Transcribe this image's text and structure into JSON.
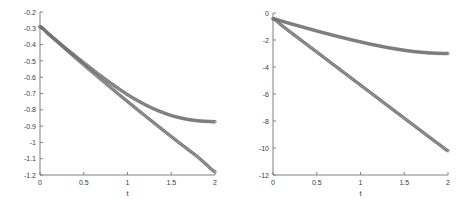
{
  "figure": {
    "background": "#ffffff",
    "axis_color": "#808080",
    "tick_label_color": "#3a3a3a",
    "panel_count": 2
  },
  "chart_data": [
    {
      "id": "left-panel",
      "type": "line",
      "title": "",
      "subtitle": "",
      "xlabel": "t",
      "ylabel": "",
      "xlim": [
        0,
        2
      ],
      "ylim": [
        -1.2,
        -0.2
      ],
      "grid": false,
      "legend": null,
      "xticks": [
        0,
        0.5,
        1,
        1.5,
        2
      ],
      "xticklabels": [
        "0",
        "0.5",
        "1",
        "1.5",
        "2"
      ],
      "yticks": [
        -0.2,
        -0.3,
        -0.4,
        -0.5,
        -0.6,
        -0.7,
        -0.8,
        -0.9,
        -1,
        -1.1,
        -1.2
      ],
      "yticklabels": [
        "-0.2",
        "-0.3",
        "-0.4",
        "-0.5",
        "-0.6",
        "-0.7",
        "-0.8",
        "-0.9",
        "-1",
        "-1.1",
        "-1.2"
      ],
      "marker": "circle",
      "marker_color": "#6e6e6e",
      "series": [
        {
          "name": "upper-curve",
          "color": "#6e6e6e",
          "x": [
            0,
            0.1,
            0.2,
            0.3,
            0.4,
            0.5,
            0.6,
            0.7,
            0.8,
            0.9,
            1.0,
            1.1,
            1.2,
            1.3,
            1.4,
            1.5,
            1.6,
            1.7,
            1.8,
            1.9,
            2.0
          ],
          "values": [
            -0.29,
            -0.335,
            -0.38,
            -0.425,
            -0.468,
            -0.511,
            -0.553,
            -0.594,
            -0.633,
            -0.671,
            -0.707,
            -0.739,
            -0.768,
            -0.794,
            -0.816,
            -0.835,
            -0.849,
            -0.86,
            -0.867,
            -0.871,
            -0.873
          ]
        },
        {
          "name": "lower-curve",
          "color": "#6e6e6e",
          "x": [
            0,
            0.1,
            0.2,
            0.3,
            0.4,
            0.5,
            0.6,
            0.7,
            0.8,
            0.9,
            1.0,
            1.1,
            1.2,
            1.3,
            1.4,
            1.5,
            1.6,
            1.7,
            1.8,
            1.9,
            2.0
          ],
          "values": [
            -0.29,
            -0.337,
            -0.384,
            -0.431,
            -0.478,
            -0.524,
            -0.57,
            -0.615,
            -0.66,
            -0.705,
            -0.749,
            -0.793,
            -0.836,
            -0.879,
            -0.922,
            -0.964,
            -1.006,
            -1.047,
            -1.088,
            -1.135,
            -1.18
          ]
        }
      ]
    },
    {
      "id": "right-panel",
      "type": "line",
      "title": "",
      "subtitle": "",
      "xlabel": "t",
      "ylabel": "",
      "xlim": [
        0,
        2
      ],
      "ylim": [
        -12,
        0
      ],
      "grid": false,
      "legend": null,
      "xticks": [
        0,
        0.5,
        1,
        1.5,
        2
      ],
      "xticklabels": [
        "0",
        "0.5",
        "1",
        "1.5",
        "2"
      ],
      "yticks": [
        0,
        -2,
        -4,
        -6,
        -8,
        -10,
        -12
      ],
      "yticklabels": [
        "0",
        "-2",
        "-4",
        "-6",
        "-8",
        "-10",
        "-12"
      ],
      "marker": "circle",
      "marker_color": "#6e6e6e",
      "series": [
        {
          "name": "upper-curve",
          "color": "#6e6e6e",
          "x": [
            0,
            0.1,
            0.2,
            0.3,
            0.4,
            0.5,
            0.6,
            0.7,
            0.8,
            0.9,
            1.0,
            1.1,
            1.2,
            1.3,
            1.4,
            1.5,
            1.6,
            1.7,
            1.8,
            1.9,
            2.0
          ],
          "values": [
            -0.42,
            -0.6,
            -0.79,
            -0.97,
            -1.15,
            -1.33,
            -1.5,
            -1.67,
            -1.83,
            -1.99,
            -2.14,
            -2.29,
            -2.42,
            -2.55,
            -2.66,
            -2.76,
            -2.85,
            -2.91,
            -2.96,
            -2.99,
            -3.0
          ]
        },
        {
          "name": "lower-curve",
          "color": "#6e6e6e",
          "x": [
            0,
            0.1,
            0.2,
            0.3,
            0.4,
            0.5,
            0.6,
            0.7,
            0.8,
            0.9,
            1.0,
            1.1,
            1.2,
            1.3,
            1.4,
            1.5,
            1.6,
            1.7,
            1.8,
            1.9,
            2.0
          ],
          "values": [
            -0.42,
            -0.92,
            -1.42,
            -1.91,
            -2.4,
            -2.89,
            -3.38,
            -3.87,
            -4.36,
            -4.85,
            -5.34,
            -5.83,
            -6.32,
            -6.81,
            -7.3,
            -7.79,
            -8.28,
            -8.77,
            -9.26,
            -9.74,
            -10.2
          ]
        }
      ]
    }
  ]
}
